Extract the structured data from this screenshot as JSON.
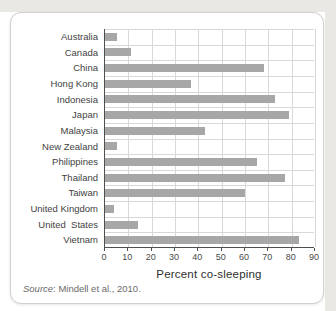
{
  "chart_data": {
    "type": "bar",
    "orientation": "horizontal",
    "categories": [
      "Australia",
      "Canada",
      "China",
      "Hong Kong",
      "Indonesia",
      "Japan",
      "Malaysia",
      "New Zealand",
      "Philippines",
      "Thailand",
      "Taiwan",
      "United Kingdom",
      "United  States",
      "Vietnam"
    ],
    "values": [
      5,
      11,
      68,
      37,
      73,
      79,
      43,
      5,
      65,
      77,
      60,
      4,
      14,
      83
    ],
    "title": "",
    "xlabel": "Percent co-sleeping",
    "ylabel": "",
    "xlim": [
      0,
      90
    ],
    "xticks": [
      0,
      10,
      20,
      30,
      40,
      50,
      60,
      70,
      80,
      90
    ],
    "grid": true,
    "bar_color": "#a7a7a7",
    "gridline_color": "#d8d8d8",
    "axis_color": "#4f4f4f"
  },
  "source": {
    "label": "Source",
    "text": ": Mindell et al., 2010."
  }
}
